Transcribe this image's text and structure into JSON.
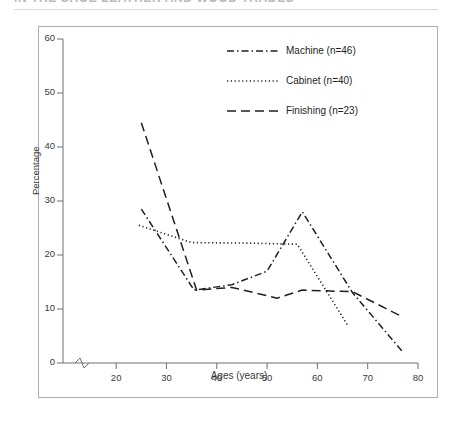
{
  "header": {
    "running_head": "IN THE SHOE LEATHER AND WOOD TRADES"
  },
  "figure": {
    "xlabel": "Ages (years)",
    "ylabel": "Percentage"
  },
  "chart_data": {
    "type": "line",
    "title": "",
    "xlabel": "Ages (years)",
    "ylabel": "Percentage",
    "xlim": [
      15,
      80
    ],
    "ylim": [
      0,
      60
    ],
    "xticks": [
      20,
      30,
      40,
      50,
      60,
      70,
      80
    ],
    "yticks": [
      0,
      10,
      20,
      30,
      40,
      50,
      60
    ],
    "grid": false,
    "x_axis_break": true,
    "legend_position": "top-right",
    "series": [
      {
        "name": "Machine (n=46)",
        "linestyle": "dash-dot",
        "color": "#231f20",
        "points": [
          {
            "x": 25,
            "y": 28.5
          },
          {
            "x": 35.5,
            "y": 13.5
          },
          {
            "x": 43,
            "y": 14.5
          },
          {
            "x": 50,
            "y": 17.0
          },
          {
            "x": 57,
            "y": 28.0
          },
          {
            "x": 67,
            "y": 13.0
          },
          {
            "x": 77,
            "y": 2.0
          }
        ]
      },
      {
        "name": "Cabinet (n=40)",
        "linestyle": "dotted",
        "color": "#231f20",
        "points": [
          {
            "x": 24.5,
            "y": 25.5
          },
          {
            "x": 35,
            "y": 22.3
          },
          {
            "x": 46,
            "y": 22.2
          },
          {
            "x": 56,
            "y": 22.0
          },
          {
            "x": 66,
            "y": 7.0
          }
        ]
      },
      {
        "name": "Finishing (n=23)",
        "linestyle": "dashed",
        "color": "#231f20",
        "points": [
          {
            "x": 25,
            "y": 44.5
          },
          {
            "x": 36,
            "y": 13.5
          },
          {
            "x": 43,
            "y": 14.0
          },
          {
            "x": 52,
            "y": 12.0
          },
          {
            "x": 57,
            "y": 13.5
          },
          {
            "x": 67,
            "y": 13.2
          },
          {
            "x": 77,
            "y": 8.5
          }
        ]
      }
    ]
  },
  "legend": [
    {
      "label": "Machine (n=46)",
      "style": "dash-dot"
    },
    {
      "label": "Cabinet (n=40)",
      "style": "dotted"
    },
    {
      "label": "Finishing (n=23)",
      "style": "dashed"
    }
  ]
}
